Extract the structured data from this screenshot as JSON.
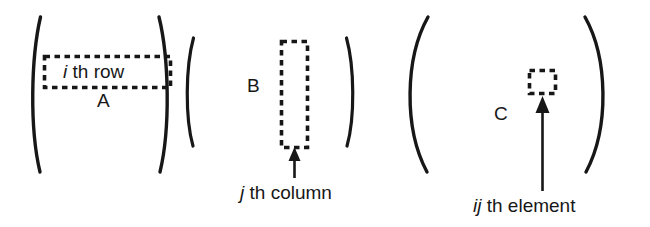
{
  "figure": {
    "background_color": "#ffffff",
    "ink_color": "#171717",
    "matrices": [
      {
        "name": "A",
        "name_label": "A",
        "highlight": "row",
        "highlight_label_italic": "i",
        "highlight_label_rest": "th  row",
        "highlight_label_full": "i th  row"
      },
      {
        "name": "B",
        "name_label": "B",
        "highlight": "column",
        "callout_italic": "j",
        "callout_rest": "th column",
        "callout_full": "j th column"
      },
      {
        "name": "C",
        "name_label": "C",
        "highlight": "element",
        "callout_italic": "ij",
        "callout_rest": "th element",
        "callout_full": "ij th element"
      }
    ]
  }
}
